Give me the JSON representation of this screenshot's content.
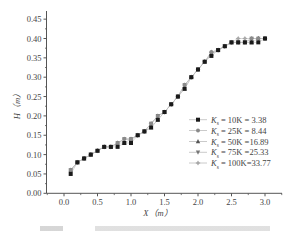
{
  "chart_data": {
    "type": "scatter",
    "title": "",
    "xlabel": "X（m）",
    "ylabel": "H（m）",
    "xlim": [
      -0.27,
      3.27
    ],
    "ylim": [
      0.0,
      0.45
    ],
    "xticks": [
      "0.0",
      "0.5",
      "1.0",
      "1.5",
      "2.0",
      "2.5",
      "3.0"
    ],
    "xtick_values": [
      0.0,
      0.5,
      1.0,
      1.5,
      2.0,
      2.5,
      3.0
    ],
    "yticks": [
      "0.00",
      "0.05",
      "0.10",
      "0.15",
      "0.20",
      "0.25",
      "0.30",
      "0.35",
      "0.40",
      "0.45"
    ],
    "ytick_values": [
      0.0,
      0.05,
      0.1,
      0.15,
      0.2,
      0.25,
      0.3,
      0.35,
      0.4,
      0.45
    ],
    "grid": false,
    "legend_position": "lower right",
    "x": [
      0.1,
      0.2,
      0.3,
      0.4,
      0.5,
      0.6,
      0.7,
      0.8,
      0.9,
      1.0,
      1.1,
      1.2,
      1.3,
      1.4,
      1.5,
      1.6,
      1.7,
      1.8,
      1.9,
      2.0,
      2.1,
      2.2,
      2.3,
      2.4,
      2.5,
      2.6,
      2.7,
      2.8,
      2.9,
      3.0
    ],
    "series": [
      {
        "name": "Ks= 10K = 3.38",
        "marker": "square",
        "color": "#1a1a1a",
        "values": [
          0.05,
          0.08,
          0.09,
          0.1,
          0.11,
          0.12,
          0.12,
          0.12,
          0.13,
          0.13,
          0.15,
          0.16,
          0.17,
          0.19,
          0.21,
          0.23,
          0.25,
          0.27,
          0.3,
          0.32,
          0.34,
          0.355,
          0.37,
          0.38,
          0.39,
          0.39,
          0.39,
          0.39,
          0.39,
          0.4
        ]
      },
      {
        "name": "Ks= 25K = 8.44",
        "marker": "circle",
        "color": "#8a8a8a",
        "values": [
          0.06,
          0.08,
          0.09,
          0.1,
          0.11,
          0.12,
          0.12,
          0.13,
          0.14,
          0.14,
          0.15,
          0.16,
          0.18,
          0.2,
          0.21,
          0.23,
          0.25,
          0.28,
          0.3,
          0.32,
          0.34,
          0.365,
          0.37,
          0.38,
          0.39,
          0.39,
          0.39,
          0.4,
          0.4,
          0.4
        ]
      },
      {
        "name": "Ks= 50K =16.89",
        "marker": "triangle-up",
        "color": "#555555",
        "values": [
          0.06,
          0.08,
          0.09,
          0.1,
          0.11,
          0.12,
          0.12,
          0.13,
          0.13,
          0.14,
          0.15,
          0.16,
          0.17,
          0.19,
          0.21,
          0.23,
          0.25,
          0.27,
          0.3,
          0.32,
          0.34,
          0.36,
          0.37,
          0.38,
          0.39,
          0.39,
          0.39,
          0.39,
          0.4,
          0.4
        ]
      },
      {
        "name": "Ks= 75K =25.33",
        "marker": "triangle-down",
        "color": "#777777",
        "values": [
          0.06,
          0.08,
          0.09,
          0.1,
          0.11,
          0.12,
          0.12,
          0.13,
          0.14,
          0.14,
          0.15,
          0.16,
          0.18,
          0.2,
          0.21,
          0.23,
          0.25,
          0.28,
          0.3,
          0.32,
          0.34,
          0.36,
          0.37,
          0.38,
          0.39,
          0.39,
          0.39,
          0.4,
          0.4,
          0.4
        ]
      },
      {
        "name": "Ks= 100K=33.77",
        "marker": "star",
        "color": "#a8a8a8",
        "values": [
          0.06,
          0.08,
          0.09,
          0.1,
          0.11,
          0.12,
          0.12,
          0.13,
          0.14,
          0.14,
          0.15,
          0.16,
          0.18,
          0.2,
          0.21,
          0.23,
          0.25,
          0.28,
          0.3,
          0.32,
          0.34,
          0.365,
          0.37,
          0.38,
          0.39,
          0.4,
          0.4,
          0.4,
          0.4,
          0.4
        ]
      }
    ]
  },
  "legend": {
    "items": [
      {
        "prefix": "K",
        "sub": "s",
        "text": "=  10K = 3.38",
        "marker": "square"
      },
      {
        "prefix": "K",
        "sub": "s",
        "text": "=  25K = 8.44",
        "marker": "circle"
      },
      {
        "prefix": "K",
        "sub": "s",
        "text": "=  50K =16.89",
        "marker": "triangle-up"
      },
      {
        "prefix": "K",
        "sub": "s",
        "text": "=  75K =25.33",
        "marker": "triangle-down"
      },
      {
        "prefix": "K",
        "sub": "s",
        "text": "= 100K=33.77",
        "marker": "star"
      }
    ]
  },
  "colors": {
    "axis": "#555555",
    "line": "#bdbdbd",
    "text": "#444444"
  }
}
